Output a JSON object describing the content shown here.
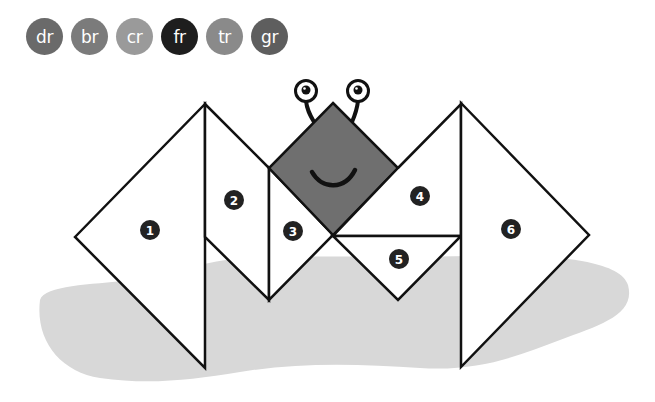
{
  "chips": [
    {
      "label": "dr",
      "color": "#6a6a6a",
      "selected": false
    },
    {
      "label": "br",
      "color": "#7b7b7b",
      "selected": false
    },
    {
      "label": "cr",
      "color": "#9a9a9a",
      "selected": false
    },
    {
      "label": "fr",
      "color": "#1e1e1e",
      "selected": true
    },
    {
      "label": "tr",
      "color": "#8a8a8a",
      "selected": false
    },
    {
      "label": "gr",
      "color": "#5e5e5e",
      "selected": false
    }
  ],
  "puzzle": {
    "pieces": [
      {
        "number": "1",
        "shape": "large-triangle"
      },
      {
        "number": "2",
        "shape": "parallelogram"
      },
      {
        "number": "3",
        "shape": "small-triangle"
      },
      {
        "number": "4",
        "shape": "parallelogram"
      },
      {
        "number": "5",
        "shape": "small-triangle"
      },
      {
        "number": "6",
        "shape": "large-triangle"
      }
    ],
    "head": {
      "shape": "square",
      "color": "#6f6f6f"
    },
    "shadow_color": "#d6d6d6"
  }
}
